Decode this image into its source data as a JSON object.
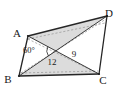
{
  "figure": {
    "name": "parallelogram-with-diagonals",
    "background_color": "#ffffff",
    "fill_color": "#dcdcdc",
    "stroke_color": "#262626",
    "dashed_stroke_color": "#9a9a9a",
    "vertices": [
      {
        "id": "A",
        "label": "A",
        "x": 28,
        "y": 36,
        "label_x": 17,
        "label_y": 33
      },
      {
        "id": "D",
        "label": "D",
        "x": 107,
        "y": 16,
        "label_x": 109,
        "label_y": 13
      },
      {
        "id": "B",
        "label": "B",
        "x": 19,
        "y": 76,
        "label_x": 8,
        "label_y": 79
      },
      {
        "id": "C",
        "label": "C",
        "x": 99,
        "y": 74,
        "label_x": 103,
        "label_y": 80
      }
    ],
    "measures": [
      {
        "id": "diagonal-bd",
        "label": "12",
        "x": 52,
        "y": 65
      },
      {
        "id": "diagonal-ac",
        "label": "9",
        "x": 74,
        "y": 57
      },
      {
        "id": "angle-at-intersection",
        "label": "60°",
        "x": 29,
        "y": 53
      }
    ],
    "solid_edges": [
      {
        "id": "edge-ad",
        "from": "A",
        "to": "D"
      },
      {
        "id": "edge-bc",
        "from": "B",
        "to": "C"
      },
      {
        "id": "edge-ab",
        "from": "A",
        "to": "B"
      },
      {
        "id": "edge-dc",
        "from": "D",
        "to": "C"
      },
      {
        "id": "diagonal-ac",
        "from": "A",
        "to": "C"
      },
      {
        "id": "diagonal-bd",
        "from": "B",
        "to": "D"
      }
    ],
    "dashed_edges": [
      {
        "id": "hidden-edge-a-to-c-lower",
        "x1": 28,
        "y1": 39,
        "x2": 99,
        "y2": 74
      },
      {
        "id": "hidden-edge-a-to-d-lower",
        "x1": 28,
        "y1": 39,
        "x2": 105,
        "y2": 23
      },
      {
        "id": "hidden-edge-b-to-d-upper",
        "x1": 21,
        "y1": 73,
        "x2": 106,
        "y2": 19
      },
      {
        "id": "hidden-edge-b-to-c-upper",
        "x1": 21,
        "y1": 73,
        "x2": 98,
        "y2": 71
      }
    ]
  }
}
